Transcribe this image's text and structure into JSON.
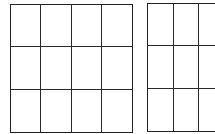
{
  "diagram": {
    "grids": [
      {
        "id": "left",
        "rows": 3,
        "columns": 4,
        "line_color": "#222222",
        "fully_visible": true
      },
      {
        "id": "right",
        "rows": 3,
        "columns_visible": 3,
        "line_color": "#222222",
        "fully_visible": false,
        "clipped_edge": "right"
      }
    ],
    "background": "#ffffff"
  }
}
